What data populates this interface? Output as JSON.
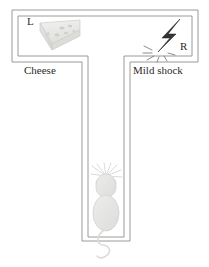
{
  "figure": {
    "name": "t-maze-diagram",
    "background_color": "#ffffff",
    "wall_color": "#8a8a8a",
    "arms": {
      "left": {
        "arm_marker": "L",
        "reward_label": "Cheese",
        "reward_icon": "cheese-wedge-icon",
        "reward_color": "#e8e8e6"
      },
      "right": {
        "arm_marker": "R",
        "outcome_label": "Mild shock",
        "outcome_icon": "lightning-bolt-icon",
        "outcome_color": "#2e2e2e"
      }
    },
    "subject": {
      "icon": "mouse-icon",
      "body_color": "#e4e4e2",
      "outline_color": "#cfcfcd",
      "position": "start-arm-bottom"
    }
  }
}
